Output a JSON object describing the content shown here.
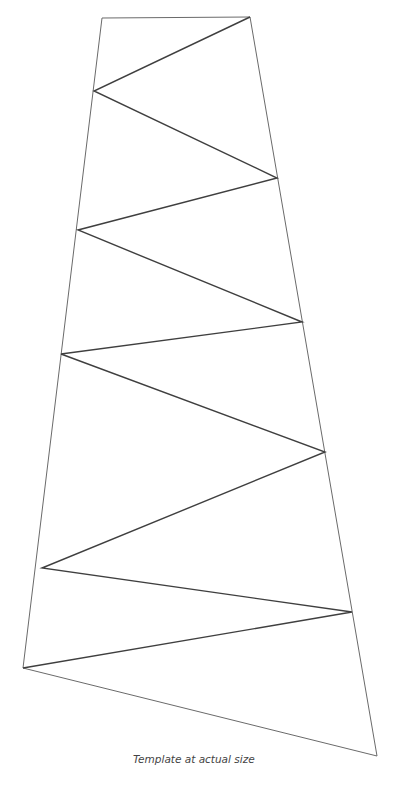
{
  "diagram": {
    "kind": "folding-template",
    "outline": [
      [
        102,
        18
      ],
      [
        250,
        17
      ],
      [
        377,
        756
      ],
      [
        23,
        668
      ]
    ],
    "zigzag_points": [
      [
        250,
        17
      ],
      [
        94,
        91
      ],
      [
        277,
        178
      ],
      [
        78,
        230
      ],
      [
        302,
        322
      ],
      [
        61,
        354
      ],
      [
        325,
        452
      ],
      [
        42,
        568
      ],
      [
        352,
        612
      ],
      [
        23,
        668
      ]
    ],
    "colors": {
      "outline": "#6a6a6a",
      "zigzag": "#3f3f3f",
      "background": "#ffffff"
    }
  },
  "caption": {
    "text": "Template at actual size"
  }
}
